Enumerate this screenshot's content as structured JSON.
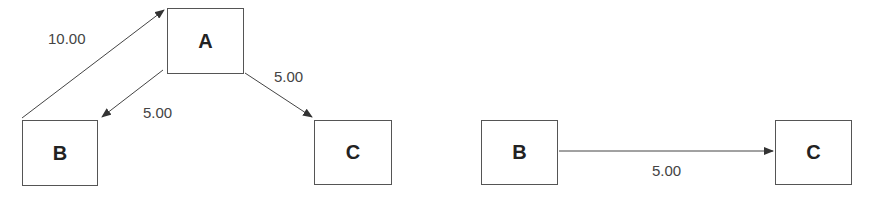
{
  "left_graph": {
    "nodes": [
      {
        "id": "A",
        "label": "A"
      },
      {
        "id": "B",
        "label": "B"
      },
      {
        "id": "C",
        "label": "C"
      }
    ],
    "edges": [
      {
        "from": "B",
        "to": "A",
        "weight": "10.00"
      },
      {
        "from": "A",
        "to": "B",
        "weight": "5.00"
      },
      {
        "from": "A",
        "to": "C",
        "weight": "5.00"
      }
    ]
  },
  "right_graph": {
    "nodes": [
      {
        "id": "B",
        "label": "B"
      },
      {
        "id": "C",
        "label": "C"
      }
    ],
    "edges": [
      {
        "from": "B",
        "to": "C",
        "weight": "5.00"
      }
    ]
  },
  "colors": {
    "line": "#444444",
    "border": "#555555",
    "text": "#222222"
  }
}
